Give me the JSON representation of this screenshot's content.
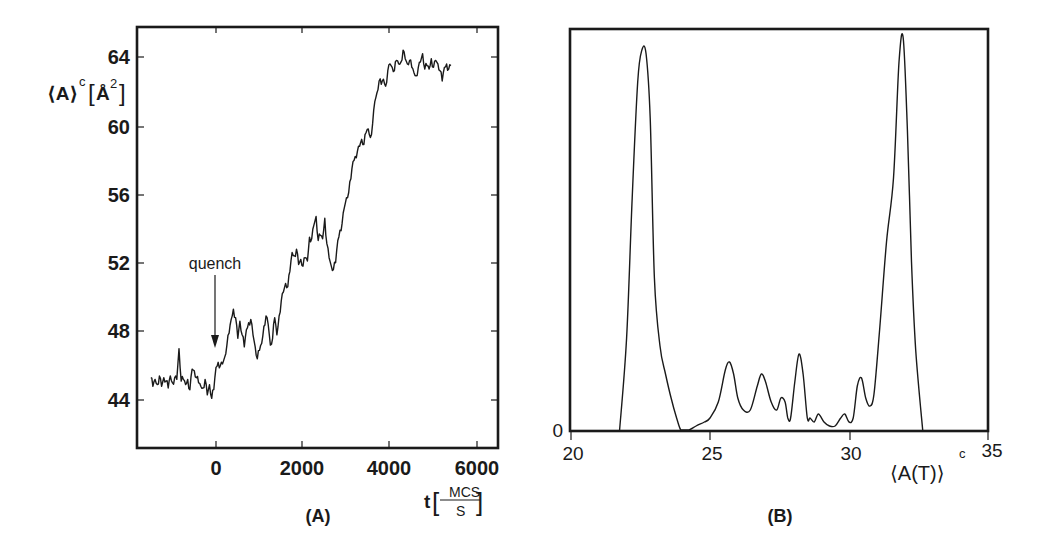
{
  "chart_data": [
    {
      "panel": "(A)",
      "type": "line",
      "title": "",
      "xlabel": "t [MCS/S]",
      "xlabel_parts": {
        "var": "t",
        "num": "MCS",
        "den": "S"
      },
      "ylabel": "⟨A⟩ᶜ [Å²]",
      "ylabel_parts": {
        "main": "⟨A⟩",
        "sup": "c",
        "unit": "Å",
        "unit_sup": "2"
      },
      "xlim": [
        -1600,
        6400
      ],
      "ylim": [
        42,
        66
      ],
      "x_ticks": [
        0,
        2000,
        4000,
        6000
      ],
      "x_tick_labels": [
        "0",
        "2000",
        "4000",
        "6000"
      ],
      "y_ticks": [
        44,
        48,
        52,
        56,
        60,
        64
      ],
      "y_tick_labels": [
        "44",
        "48",
        "52",
        "56",
        "60",
        "64"
      ],
      "grid": false,
      "annotations": [
        {
          "text": "quench",
          "x": 0,
          "y_arrow_tip": 47.2,
          "arrow": "down"
        }
      ],
      "series": [
        {
          "name": "area per lipid",
          "x": [
            -1500,
            -1450,
            -1400,
            -1350,
            -1300,
            -1250,
            -1200,
            -1150,
            -1100,
            -1050,
            -1000,
            -950,
            -900,
            -850,
            -800,
            -750,
            -700,
            -650,
            -600,
            -550,
            -500,
            -450,
            -400,
            -350,
            -300,
            -250,
            -200,
            -150,
            -100,
            -50,
            0,
            50,
            100,
            150,
            200,
            250,
            300,
            350,
            400,
            450,
            500,
            550,
            600,
            650,
            700,
            750,
            800,
            850,
            900,
            950,
            1000,
            1050,
            1100,
            1150,
            1200,
            1250,
            1300,
            1350,
            1400,
            1450,
            1500,
            1550,
            1600,
            1650,
            1700,
            1750,
            1800,
            1850,
            1900,
            1950,
            2000,
            2050,
            2100,
            2150,
            2200,
            2250,
            2300,
            2350,
            2400,
            2450,
            2500,
            2550,
            2600,
            2650,
            2700,
            2750,
            2800,
            2850,
            2900,
            2950,
            3000,
            3050,
            3100,
            3150,
            3200,
            3250,
            3300,
            3350,
            3400,
            3450,
            3500,
            3550,
            3600,
            3650,
            3700,
            3750,
            3800,
            3850,
            3900,
            3950,
            4000,
            4050,
            4100,
            4150,
            4200,
            4250,
            4300,
            4350,
            4400,
            4450,
            4500,
            4550,
            4600,
            4650,
            4700,
            4750,
            4800,
            4850,
            4900,
            4950,
            5000,
            5050,
            5100,
            5150,
            5200,
            5250,
            5300,
            5350,
            5400,
            5450,
            5500,
            5550,
            5600,
            5650,
            5700,
            5750,
            5800,
            5850,
            5900,
            5950,
            6000
          ],
          "y": [
            45.3,
            44.8,
            45.2,
            44.9,
            45.4,
            44.8,
            45.3,
            45.1,
            44.7,
            45.4,
            45.0,
            45.3,
            45.2,
            47.0,
            45.1,
            45.2,
            44.9,
            45.2,
            44.6,
            45.8,
            45.7,
            45.3,
            45.0,
            44.8,
            44.7,
            45.2,
            44.3,
            44.9,
            44.1,
            44.6,
            45.9,
            46.2,
            46.0,
            46.1,
            46.5,
            47.2,
            47.9,
            48.7,
            49.3,
            48.8,
            47.6,
            48.6,
            47.8,
            47.1,
            48.1,
            48.5,
            48.7,
            47.8,
            47.1,
            46.4,
            46.9,
            47.3,
            48.3,
            48.9,
            48.4,
            47.2,
            47.6,
            48.8,
            47.8,
            48.9,
            49.8,
            50.3,
            50.8,
            50.6,
            51.5,
            52.6,
            52.4,
            52.8,
            51.9,
            52.2,
            51.8,
            52.3,
            52.1,
            53.5,
            53.4,
            54.2,
            54.7,
            53.3,
            53.6,
            53.4,
            54.6,
            53.1,
            52.3,
            51.8,
            51.6,
            52.0,
            53.3,
            53.9,
            54.3,
            55.2,
            55.8,
            56.1,
            56.9,
            57.9,
            58.2,
            58.5,
            58.8,
            59.2,
            58.9,
            59.6,
            59.8,
            59.3,
            60.1,
            61.4,
            61.9,
            62.6,
            62.4,
            62.7,
            62.3,
            63.2,
            63.6,
            63.4,
            63.2,
            63.8,
            63.6,
            63.7,
            64.4,
            63.9,
            63.6,
            63.8,
            63.4,
            63.1,
            62.9,
            63.4,
            63.7,
            64.2,
            63.3,
            63.5,
            63.3,
            63.9,
            63.4,
            63.8,
            63.6,
            63.2,
            62.6,
            63.4,
            63.6,
            63.3,
            63.5
          ]
        }
      ]
    },
    {
      "panel": "(B)",
      "type": "line",
      "title": "",
      "xlabel": "⟨A(T)⟩ᶜ",
      "xlabel_parts": {
        "main": "⟨A(T)⟩",
        "sup": "c"
      },
      "ylabel": "",
      "xlim": [
        20,
        35
      ],
      "ylim": [
        0,
        1.0
      ],
      "x_ticks": [
        20,
        25,
        30,
        35
      ],
      "x_tick_labels": [
        "20",
        "25",
        "30",
        "35"
      ],
      "y_ticks": [
        0
      ],
      "y_tick_labels": [
        "0"
      ],
      "grid": false,
      "series": [
        {
          "name": "distribution",
          "x": [
            21.75,
            22.0,
            22.2,
            22.4,
            22.55,
            22.7,
            22.85,
            23.0,
            23.2,
            23.4,
            23.6,
            23.8,
            23.95,
            24.1,
            24.25,
            24.5,
            24.8,
            25.0,
            25.3,
            25.55,
            25.7,
            25.85,
            26.0,
            26.2,
            26.45,
            26.7,
            26.85,
            27.0,
            27.2,
            27.4,
            27.55,
            27.7,
            27.8,
            27.9,
            28.05,
            28.2,
            28.35,
            28.5,
            28.6,
            28.75,
            28.9,
            29.1,
            29.3,
            29.5,
            29.7,
            29.85,
            30.0,
            30.15,
            30.3,
            30.45,
            30.6,
            30.75,
            30.9,
            31.1,
            31.35,
            31.6,
            31.8,
            31.95,
            32.1,
            32.25,
            32.4,
            32.65
          ],
          "y": [
            0.0,
            0.23,
            0.58,
            0.87,
            0.95,
            0.94,
            0.78,
            0.38,
            0.21,
            0.14,
            0.08,
            0.03,
            0.0,
            0.0,
            0.0,
            0.01,
            0.02,
            0.03,
            0.07,
            0.15,
            0.17,
            0.14,
            0.08,
            0.05,
            0.05,
            0.11,
            0.14,
            0.12,
            0.07,
            0.05,
            0.08,
            0.07,
            0.03,
            0.03,
            0.12,
            0.19,
            0.14,
            0.03,
            0.03,
            0.02,
            0.04,
            0.02,
            0.01,
            0.01,
            0.03,
            0.04,
            0.02,
            0.03,
            0.11,
            0.13,
            0.08,
            0.06,
            0.09,
            0.25,
            0.47,
            0.63,
            0.92,
            0.98,
            0.75,
            0.42,
            0.2,
            0.0
          ]
        }
      ]
    }
  ],
  "panel_a": {
    "caption": "(A)",
    "annotation": "quench",
    "ylabel_main": "⟨A⟩",
    "ylabel_sup": "c",
    "ylabel_unit": "Å",
    "ylabel_unit_sup": "2",
    "xlabel_var": "t",
    "xlabel_num": "MCS",
    "xlabel_den": "S",
    "y_tick_labels": [
      "64",
      "60",
      "56",
      "52",
      "48",
      "44"
    ],
    "x_tick_labels": [
      "0",
      "2000",
      "4000",
      "6000"
    ]
  },
  "panel_b": {
    "caption": "(B)",
    "xlabel_main": "⟨A(T)⟩",
    "xlabel_sup": "c",
    "y_tick_label": "0",
    "x_tick_labels": [
      "20",
      "25",
      "30",
      "35"
    ]
  },
  "colors": {
    "ink": "#1a1a1a",
    "background": "#ffffff"
  }
}
